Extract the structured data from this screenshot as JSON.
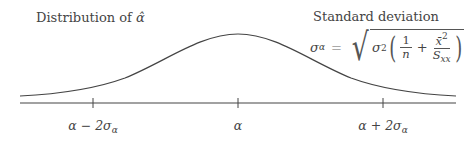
{
  "titles": {
    "left": "Distribution of",
    "left_symbol": "α̂",
    "right": "Standard deviation"
  },
  "formula": {
    "lhs": "σ",
    "lhs_sub": "α",
    "equals": "=",
    "sigma": "σ",
    "sigma_exp": "2",
    "frac1_num": "1",
    "frac1_den": "n",
    "plus": "+",
    "frac2_num": "x̄",
    "frac2_num_exp": "2",
    "frac2_den": "S",
    "frac2_den_sub": "xx",
    "open_paren": "(",
    "close_paren": ")",
    "radical": "√"
  },
  "axis": {
    "ticks": [
      {
        "base": "α − 2σ",
        "sub": "α",
        "x": 93
      },
      {
        "base": "α",
        "sub": "",
        "x": 238
      },
      {
        "base": "α + 2σ",
        "sub": "α",
        "x": 383
      }
    ]
  },
  "colors": {
    "line": "#444444",
    "text": "#444444"
  }
}
